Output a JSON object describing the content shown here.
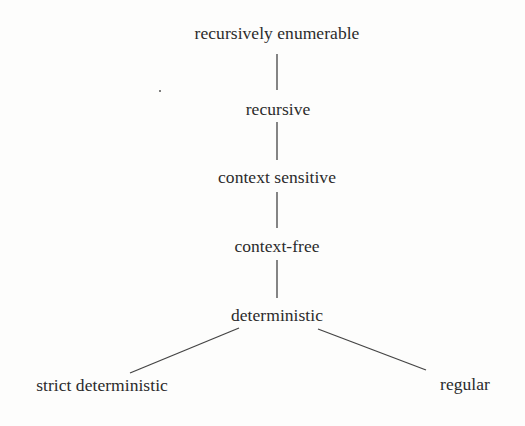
{
  "diagram": {
    "type": "hierarchy",
    "title": "",
    "nodes": [
      {
        "id": "re",
        "label": "recursively enumerable",
        "cx": 277,
        "top": 25
      },
      {
        "id": "rec",
        "label": "recursive",
        "cx": 278,
        "top": 101
      },
      {
        "id": "cs",
        "label": "context sensitive",
        "cx": 277,
        "top": 169
      },
      {
        "id": "cf",
        "label": "context-free",
        "cx": 277,
        "top": 238
      },
      {
        "id": "det",
        "label": "deterministic",
        "cx": 277,
        "top": 307
      },
      {
        "id": "sdet",
        "label": "strict deterministic",
        "cx": 102,
        "top": 377
      },
      {
        "id": "reg",
        "label": "regular",
        "cx": 465,
        "top": 376
      }
    ],
    "edges": [
      {
        "from": "re",
        "to": "rec",
        "x1": 277,
        "y1": 54,
        "x2": 277,
        "y2": 90
      },
      {
        "from": "rec",
        "to": "cs",
        "x1": 277,
        "y1": 122,
        "x2": 277,
        "y2": 160
      },
      {
        "from": "cs",
        "to": "cf",
        "x1": 277,
        "y1": 192,
        "x2": 277,
        "y2": 228
      },
      {
        "from": "cf",
        "to": "det",
        "x1": 277,
        "y1": 260,
        "x2": 277,
        "y2": 298
      },
      {
        "from": "det",
        "to": "sdet",
        "x1": 239,
        "y1": 328,
        "x2": 130,
        "y2": 373
      },
      {
        "from": "det",
        "to": "reg",
        "x1": 318,
        "y1": 329,
        "x2": 426,
        "y2": 370
      }
    ],
    "stray_mark": {
      "x": 160,
      "y": 91
    }
  }
}
